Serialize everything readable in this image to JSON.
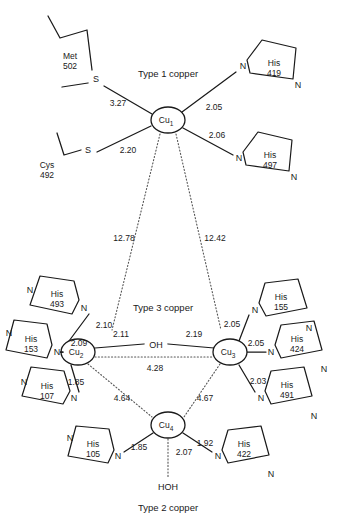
{
  "figure": {
    "sections": [
      {
        "name": "type1",
        "label": "Type 1 copper",
        "x": 168,
        "y": 74
      },
      {
        "name": "type3",
        "label": "Type 3 copper",
        "x": 163,
        "y": 308
      },
      {
        "name": "type2",
        "label": "Type 2 copper",
        "x": 168,
        "y": 508
      }
    ]
  },
  "coppers": [
    {
      "name": "cu1",
      "label": "Cu",
      "sub": "1",
      "x": 168,
      "y": 120,
      "rx": 17,
      "ry": 13
    },
    {
      "name": "cu2",
      "label": "Cu",
      "sub": "2",
      "x": 78,
      "y": 352,
      "rx": 17,
      "ry": 13
    },
    {
      "name": "cu3",
      "label": "Cu",
      "sub": "3",
      "x": 230,
      "y": 352,
      "rx": 17,
      "ry": 13
    },
    {
      "name": "cu4",
      "label": "Cu",
      "sub": "4",
      "x": 168,
      "y": 425,
      "rx": 17,
      "ry": 13
    }
  ],
  "waters": [
    {
      "name": "bridging-hydroxide",
      "label": "OH",
      "x": 155,
      "y": 345
    },
    {
      "name": "axial-water",
      "label": "HOH",
      "x": 168,
      "y": 487
    }
  ],
  "sulfurs": [
    {
      "name": "met502-sulfur",
      "label": "S",
      "x": 96,
      "y": 79
    },
    {
      "name": "cys492-sulfur",
      "label": "S",
      "x": 88,
      "y": 154
    }
  ],
  "residues": [
    {
      "name": "met-502",
      "type": "Met",
      "number": "502",
      "x": 70,
      "y": 56
    },
    {
      "name": "cys-492",
      "type": "Cys",
      "number": "492",
      "x": 47,
      "y": 165
    },
    {
      "name": "his-419",
      "type": "His",
      "number": "419",
      "x": 275,
      "y": 63
    },
    {
      "name": "his-497",
      "type": "His",
      "number": "497",
      "x": 273,
      "y": 155
    },
    {
      "name": "his-493",
      "type": "His",
      "number": "493",
      "x": 57,
      "y": 300
    },
    {
      "name": "his-153",
      "type": "His",
      "number": "153",
      "x": 30,
      "y": 348
    },
    {
      "name": "his-107",
      "type": "His",
      "number": "107",
      "x": 47,
      "y": 392
    },
    {
      "name": "his-105",
      "type": "His",
      "number": "105",
      "x": 93,
      "y": 452
    },
    {
      "name": "his-155",
      "type": "His",
      "number": "155",
      "x": 281,
      "y": 303
    },
    {
      "name": "his-424",
      "type": "His",
      "number": "424",
      "x": 297,
      "y": 352
    },
    {
      "name": "his-491",
      "type": "His",
      "number": "491",
      "x": 285,
      "y": 398
    },
    {
      "name": "his-422",
      "type": "His",
      "number": "422",
      "x": 244,
      "y": 450
    }
  ],
  "nitrogen_atoms": [
    {
      "name": "n-his419-coord",
      "label": "N",
      "x": 243,
      "y": 66
    },
    {
      "name": "n-his419-far",
      "label": "N",
      "x": 296,
      "y": 85
    },
    {
      "name": "n-his497-coord",
      "label": "N",
      "x": 239,
      "y": 158
    },
    {
      "name": "n-his497-far",
      "label": "N",
      "x": 292,
      "y": 177
    },
    {
      "name": "n-his493-coord",
      "label": "N",
      "x": 83,
      "y": 308
    },
    {
      "name": "n-his493-far",
      "label": "N",
      "x": 31,
      "y": 291
    },
    {
      "name": "n-his153-coord",
      "label": "N",
      "x": 57,
      "y": 352
    },
    {
      "name": "n-his153-far",
      "label": "N",
      "x": 9,
      "y": 333
    },
    {
      "name": "n-his107-coord",
      "label": "N",
      "x": 74,
      "y": 398
    },
    {
      "name": "n-his107-far",
      "label": "N",
      "x": 24,
      "y": 382
    },
    {
      "name": "n-his105-coord",
      "label": "N",
      "x": 118,
      "y": 456
    },
    {
      "name": "n-his105-far",
      "label": "N",
      "x": 70,
      "y": 438
    },
    {
      "name": "n-his155-coord",
      "label": "N",
      "x": 255,
      "y": 310
    },
    {
      "name": "n-his155-far",
      "label": "N",
      "x": 307,
      "y": 328
    },
    {
      "name": "n-his424-coord",
      "label": "N",
      "x": 271,
      "y": 352
    },
    {
      "name": "n-his424-far",
      "label": "N",
      "x": 321,
      "y": 369
    },
    {
      "name": "n-his491-coord",
      "label": "N",
      "x": 261,
      "y": 398
    },
    {
      "name": "n-his491-far",
      "label": "N",
      "x": 311,
      "y": 416
    },
    {
      "name": "n-his422-coord",
      "label": "N",
      "x": 218,
      "y": 456
    },
    {
      "name": "n-his422-far",
      "label": "N",
      "x": 268,
      "y": 474
    }
  ],
  "distances": [
    {
      "name": "dist-cu1-met502",
      "value": "3.27",
      "x": 118,
      "y": 103,
      "style": "solid"
    },
    {
      "name": "dist-cu1-cys492",
      "value": "2.20",
      "x": 128,
      "y": 150,
      "style": "solid"
    },
    {
      "name": "dist-cu1-his419",
      "value": "2.05",
      "x": 214,
      "y": 107,
      "style": "solid"
    },
    {
      "name": "dist-cu1-his497",
      "value": "2.06",
      "x": 217,
      "y": 135,
      "style": "solid"
    },
    {
      "name": "dist-cu1-cu2",
      "value": "12.78",
      "x": 124,
      "y": 238,
      "style": "dotted"
    },
    {
      "name": "dist-cu1-cu3",
      "value": "12.42",
      "x": 215,
      "y": 238,
      "style": "dotted"
    },
    {
      "name": "dist-cu2-his493",
      "value": "2.10",
      "x": 104,
      "y": 325,
      "style": "solid"
    },
    {
      "name": "dist-cu2-his153",
      "value": "2.09",
      "x": 79,
      "y": 343,
      "style": "solid"
    },
    {
      "name": "dist-cu2-his107",
      "value": "1.85",
      "x": 76,
      "y": 382,
      "style": "solid"
    },
    {
      "name": "dist-cu2-oh",
      "value": "2.11",
      "x": 129,
      "y": 339,
      "style": "solid"
    },
    {
      "name": "dist-cu3-oh",
      "value": "2.19",
      "x": 196,
      "y": 339,
      "style": "solid"
    },
    {
      "name": "dist-cu3-his155",
      "value": "2.05",
      "x": 232,
      "y": 324,
      "style": "solid"
    },
    {
      "name": "dist-cu3-his424",
      "value": "2.05",
      "x": 256,
      "y": 343,
      "style": "solid"
    },
    {
      "name": "dist-cu3-his491",
      "value": "2.03",
      "x": 258,
      "y": 381,
      "style": "solid"
    },
    {
      "name": "dist-cu2-cu3",
      "value": "4.28",
      "x": 155,
      "y": 368,
      "style": "dotted"
    },
    {
      "name": "dist-cu2-cu4",
      "value": "4.64",
      "x": 122,
      "y": 398,
      "style": "dotted"
    },
    {
      "name": "dist-cu3-cu4",
      "value": "4.67",
      "x": 205,
      "y": 398,
      "style": "dotted"
    },
    {
      "name": "dist-cu4-his105",
      "value": "1.85",
      "x": 139,
      "y": 447,
      "style": "solid"
    },
    {
      "name": "dist-cu4-his422",
      "value": "1.92",
      "x": 205,
      "y": 443,
      "style": "solid"
    },
    {
      "name": "dist-cu4-hoh",
      "value": "2.07",
      "x": 182,
      "y": 452,
      "style": "dotted"
    }
  ],
  "colors": {
    "stroke": "#1a1a1a",
    "dotted": "#555555",
    "background": "#ffffff"
  }
}
